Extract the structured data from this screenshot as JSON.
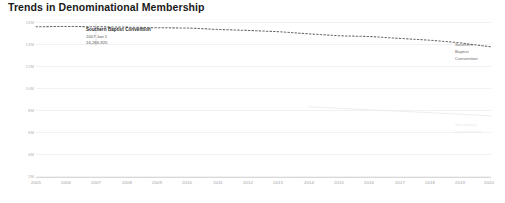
{
  "chart_data": {
    "type": "line",
    "title": "Trends in Denominational Membership",
    "xlabel": "",
    "ylabel": "",
    "xlim": [
      2005,
      2020
    ],
    "ylim": [
      0,
      17000000
    ],
    "grid": true,
    "legend_position": "right-of-line-end",
    "x": [
      2005,
      2006,
      2007,
      2008,
      2009,
      2010,
      2011,
      2012,
      2013,
      2014,
      2015,
      2016,
      2017,
      2018,
      2019,
      2020
    ],
    "categories": [
      "2005",
      "2006",
      "2007",
      "2008",
      "2009",
      "2010",
      "2011",
      "2012",
      "2013",
      "2014",
      "2015",
      "2016",
      "2017",
      "2018",
      "2019",
      "2020"
    ],
    "y_tick_labels": [
      "16M",
      "14M",
      "12M",
      "10M",
      "8M",
      "6M",
      "4M",
      "2M"
    ],
    "y_tick_values": [
      16000000,
      14000000,
      12000000,
      10000000,
      8000000,
      6000000,
      4000000,
      2000000
    ],
    "series": [
      {
        "name": "Southern Baptist Convention",
        "style": "dotted",
        "color": "#6b6b6b",
        "end_label": "Southern Baptist Convention",
        "values": [
          16270000,
          16300000,
          16266920,
          16230000,
          16160000,
          16136000,
          15978000,
          15872000,
          15735000,
          15499000,
          15294000,
          15216000,
          15006000,
          14813000,
          14525000,
          14090000
        ]
      },
      {
        "name": "Secondary Denomination",
        "style": "solid-faint",
        "color": "#ebebeb",
        "end_label": "Secondary Denomination",
        "values": [
          null,
          null,
          null,
          null,
          null,
          null,
          null,
          null,
          null,
          7600000,
          7430000,
          7270000,
          7120000,
          6960000,
          6800000,
          6620000
        ]
      }
    ],
    "annotation": {
      "marker_x": 2007,
      "title": "Southern Baptist Convention",
      "date": "2007 Jan 1",
      "value": "16,266,920"
    }
  }
}
